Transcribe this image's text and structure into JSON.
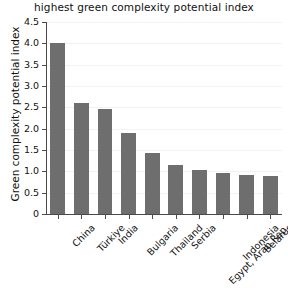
{
  "chart_data": {
    "type": "bar",
    "title": "highest green complexity potential index",
    "xlabel": "",
    "ylabel": "Green complexity potential index",
    "categories": [
      "China",
      "Türkiye",
      "India",
      "Bulgaria",
      "Thailand",
      "Serbia",
      "Egypt, Arab Rep.",
      "Indonesia",
      "Belarus",
      "Viet Nam"
    ],
    "values": [
      4.0,
      2.6,
      2.45,
      1.9,
      1.42,
      1.15,
      1.02,
      0.95,
      0.92,
      0.9
    ],
    "ylim": [
      0,
      4.5
    ],
    "yticks": [
      0,
      0.5,
      1.0,
      1.5,
      2.0,
      2.5,
      3.0,
      3.5,
      4.0,
      4.5
    ],
    "ytick_labels": [
      "0",
      "0.5",
      "1.0",
      "1.5",
      "2.0",
      "2.5",
      "3.0",
      "3.5",
      "4.0",
      "4.5"
    ],
    "grid": true,
    "legend": false,
    "bar_color": "#6e6e6e",
    "axis_color": "#4a4a4a",
    "grid_color": "#f2f2f2"
  }
}
